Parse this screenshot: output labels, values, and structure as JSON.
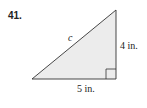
{
  "problem": {
    "number": "41."
  },
  "diagram": {
    "shape": "right-triangle",
    "fill_color": "#ececec",
    "stroke_color": "#333333",
    "hypotenuse_label": "c",
    "vertical_leg_label": "4 in.",
    "horizontal_leg_label": "5 in.",
    "right_angle_marker": true
  }
}
